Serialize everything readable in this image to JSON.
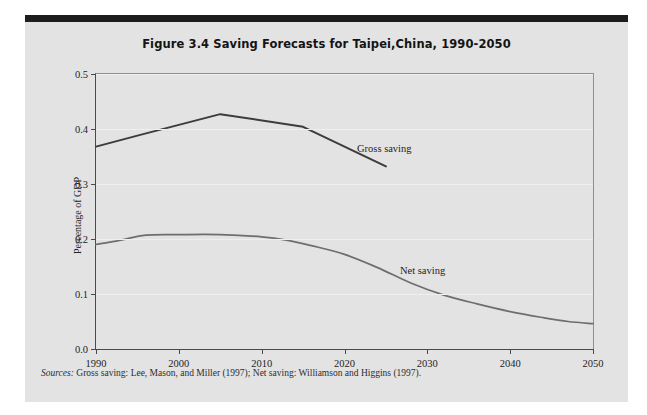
{
  "figure": {
    "title": "Figure 3.4  Saving Forecasts for Taipei,China, 1990-2050",
    "source_prefix": "Sources:",
    "source_text": " Gross saving: Lee, Mason, and Miller (1997); Net saving: Williamson and Higgins (1997).",
    "panel_color": "#e3e3e3",
    "top_bar_color": "#1d1d1d"
  },
  "chart_data": {
    "type": "line",
    "title": "Figure 3.4  Saving Forecasts for Taipei,China, 1990-2050",
    "xlabel": "",
    "ylabel": "Percentage of GDP",
    "xlim": [
      1990,
      2050
    ],
    "ylim": [
      0.0,
      0.5
    ],
    "grid": true,
    "legend_position": "inline-annotation",
    "xticks": [
      "1990",
      "2000",
      "2010",
      "2020",
      "2030",
      "2040",
      "2050"
    ],
    "xtick_values": [
      1990,
      2000,
      2010,
      2020,
      2030,
      2040,
      2050
    ],
    "yticks": [
      "0.0",
      "0.1",
      "0.2",
      "0.3",
      "0.4",
      "0.5"
    ],
    "ytick_values": [
      0.0,
      0.1,
      0.2,
      0.3,
      0.4,
      0.5
    ],
    "series": [
      {
        "name": "Gross saving",
        "color": "#3c3c3c",
        "width": 2.0,
        "x": [
          1990,
          1995,
          2005,
          2015,
          2025
        ],
        "values": [
          0.368,
          0.388,
          0.427,
          0.404,
          0.332
        ],
        "annotation": "Gross saving"
      },
      {
        "name": "Net saving",
        "color": "#6e6e6e",
        "width": 1.7,
        "x": [
          1990,
          1993,
          1996,
          2000,
          2005,
          2010,
          2013,
          2016,
          2020,
          2024,
          2028,
          2032,
          2036,
          2040,
          2044,
          2047,
          2050
        ],
        "values": [
          0.19,
          0.198,
          0.207,
          0.208,
          0.208,
          0.204,
          0.198,
          0.188,
          0.172,
          0.148,
          0.12,
          0.098,
          0.082,
          0.068,
          0.057,
          0.05,
          0.046
        ],
        "annotation": "Net saving"
      }
    ]
  }
}
